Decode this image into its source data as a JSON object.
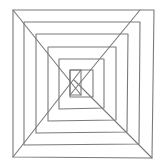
{
  "drawing": {
    "subject": "hand-drawn nested squares with diagonals",
    "stroke_color": "#7a7a7a",
    "background": "#ffffff",
    "stroke_width": 1.1,
    "squares": [
      [
        [
          13,
          10
        ],
        [
          154,
          10
        ],
        [
          152,
          158
        ],
        [
          13,
          157
        ]
      ],
      [
        [
          24,
          22
        ],
        [
          140,
          22
        ],
        [
          139,
          144
        ],
        [
          24,
          145
        ]
      ],
      [
        [
          36,
          34
        ],
        [
          128,
          34
        ],
        [
          127,
          132
        ],
        [
          36,
          133
        ]
      ],
      [
        [
          48,
          47
        ],
        [
          116,
          47
        ],
        [
          116,
          120
        ],
        [
          48,
          121
        ]
      ],
      [
        [
          59,
          59
        ],
        [
          104,
          59
        ],
        [
          104,
          108
        ],
        [
          59,
          109
        ]
      ],
      [
        [
          70,
          70
        ],
        [
          93,
          70
        ],
        [
          93,
          97
        ],
        [
          70,
          97
        ]
      ],
      [
        [
          70,
          70
        ],
        [
          81,
          70
        ],
        [
          81,
          95
        ],
        [
          70,
          95
        ]
      ]
    ],
    "diagonals": [
      [
        [
          13,
          10
        ],
        [
          81,
          95
        ]
      ],
      [
        [
          140,
          10
        ],
        [
          70,
          95
        ]
      ],
      [
        [
          152,
          158
        ],
        [
          74,
          80
        ]
      ],
      [
        [
          13,
          157
        ],
        [
          81,
          70
        ]
      ]
    ]
  }
}
